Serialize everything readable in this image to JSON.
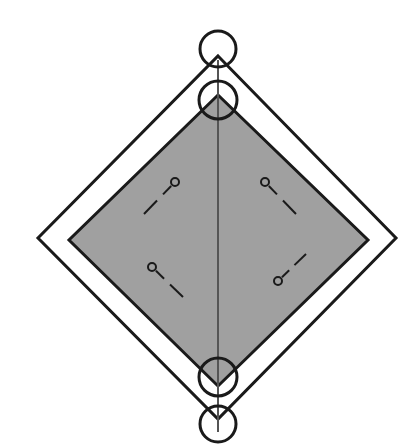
{
  "canvas": {
    "width": 416,
    "height": 448,
    "background": "#ffffff",
    "title": "Nested diamond technical line drawing"
  },
  "palette": {
    "stroke": "#1a1a1a",
    "fill_gray": "#a0a0a0",
    "fill_white": "#ffffff",
    "axis_line": "#555555"
  },
  "shapes": {
    "outer_diamond": {
      "name": "outer-diamond",
      "fill": "#ffffff",
      "stroke": "#1a1a1a",
      "stroke_width": 3,
      "top": {
        "x": 218,
        "y": 56
      },
      "right": {
        "x": 396,
        "y": 238
      },
      "bottom": {
        "x": 218,
        "y": 419
      },
      "left": {
        "x": 38,
        "y": 238
      }
    },
    "inner_diamond": {
      "name": "inner-gray-diamond",
      "fill": "#a0a0a0",
      "stroke": "#1a1a1a",
      "stroke_width": 3,
      "top": {
        "x": 218,
        "y": 95
      },
      "right": {
        "x": 368,
        "y": 240
      },
      "bottom": {
        "x": 218,
        "y": 386
      },
      "left": {
        "x": 69,
        "y": 240
      }
    },
    "center_axis": {
      "name": "center-vertical-axis",
      "stroke": "#555555",
      "stroke_width": 2,
      "x": 218,
      "y_start": 60,
      "y_end": 432
    }
  },
  "circles": [
    {
      "name": "top-outer-circle",
      "cx": 218,
      "cy": 49,
      "r": 18,
      "stroke": "#1a1a1a",
      "stroke_width": 3,
      "fill": "none",
      "label": "circle-1"
    },
    {
      "name": "top-inner-circle",
      "cx": 218,
      "cy": 100,
      "r": 19,
      "stroke": "#1a1a1a",
      "stroke_width": 3,
      "fill": "none",
      "label": "circle-2"
    },
    {
      "name": "bottom-inner-circle",
      "cx": 218,
      "cy": 377,
      "r": 19,
      "stroke": "#1a1a1a",
      "stroke_width": 3,
      "fill": "none",
      "label": "circle-3"
    },
    {
      "name": "bottom-outer-circle",
      "cx": 218,
      "cy": 424,
      "r": 18,
      "stroke": "#1a1a1a",
      "stroke_width": 3,
      "fill": "none",
      "label": "circle-4"
    }
  ],
  "pins": [
    {
      "name": "pin-upper-left",
      "head_cx": 175,
      "head_cy": 182,
      "head_r": 4,
      "tail_x": 144,
      "tail_y": 214,
      "gap_start": 0.3,
      "gap_end": 0.52,
      "stroke": "#1a1a1a",
      "stroke_width": 2
    },
    {
      "name": "pin-upper-right",
      "head_cx": 265,
      "head_cy": 182,
      "head_r": 4,
      "tail_x": 296,
      "tail_y": 214,
      "gap_start": 0.3,
      "gap_end": 0.52,
      "stroke": "#1a1a1a",
      "stroke_width": 2
    },
    {
      "name": "pin-lower-left",
      "head_cx": 152,
      "head_cy": 267,
      "head_r": 4,
      "tail_x": 183,
      "tail_y": 297,
      "gap_start": 0.3,
      "gap_end": 0.52,
      "stroke": "#1a1a1a",
      "stroke_width": 2
    },
    {
      "name": "pin-lower-right",
      "head_cx": 278,
      "head_cy": 281,
      "head_r": 4,
      "tail_x": 306,
      "tail_y": 254,
      "gap_start": 0.3,
      "gap_end": 0.52,
      "stroke": "#1a1a1a",
      "stroke_width": 2
    }
  ]
}
